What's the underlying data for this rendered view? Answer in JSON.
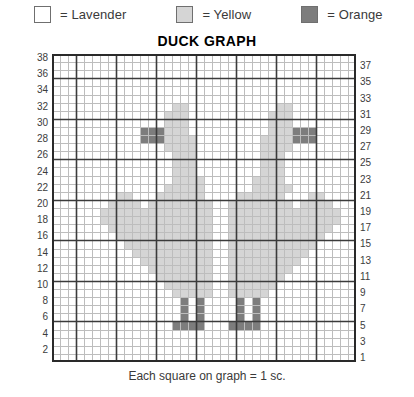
{
  "title": "DUCK GRAPH",
  "caption": "Each square on graph = 1 sc.",
  "legend": {
    "items": [
      {
        "label": "= Lavender",
        "color": "#ffffff",
        "key": "L"
      },
      {
        "label": "= Yellow",
        "color": "#d5d5d5",
        "key": "Y"
      },
      {
        "label": "= Orange",
        "color": "#7d7d7d",
        "key": "O"
      }
    ]
  },
  "axes": {
    "left_label": "row-numbers-even",
    "right_label": "row-numbers-odd",
    "left_ticks": [
      38,
      36,
      34,
      32,
      30,
      28,
      26,
      24,
      22,
      20,
      18,
      16,
      14,
      12,
      10,
      8,
      6,
      4,
      2
    ],
    "right_ticks": [
      37,
      35,
      33,
      31,
      29,
      27,
      25,
      23,
      21,
      19,
      17,
      15,
      13,
      11,
      9,
      7,
      5,
      3,
      1
    ]
  },
  "chart_data": {
    "type": "heatmap",
    "title": "DUCK GRAPH",
    "xlabel": "",
    "ylabel": "",
    "rows": 38,
    "cols": 38,
    "grid_on": true,
    "bold_every": 5,
    "legend_position": "top",
    "palette": {
      "L": "#ffffff",
      "Y": "#d5d5d5",
      "O": "#7d7d7d"
    },
    "colors_note": "L=Lavender(white), Y=Yellow(light gray), O=Orange(dark gray)",
    "row_order": "top row is 38, bottom row is 1",
    "cells": [
      "LLLLLLLLLLLLLLLLLLLLLLLLLLLLLLLLLLLLLL",
      "LLLLLLLLLLLLLLLLLLLLLLLLLLLLLLLLLLLLLL",
      "LLLLLLLLLLLLLLLLLLLLLLLLLLLLLLLLLLLLLL",
      "LLLLLLLLLLLLLLLLLLLLLLLLLLLLLLLLLLLLLL",
      "LLLLLLLLLLLLLLLLLLLLLLLLLLLLLLLLLLLLLL",
      "LLLLLLLLLLLLLLLLLLLLLLLLLLLLLLLLLLLLLL",
      "LLLLLLLLLLLLLLLYYLLLLLLLLLLLYYLLLLLLLL",
      "LLLLLLLLLLLLLLYYYLLLLLLLLLLYYYLLLLLLLL",
      "LLLLLLLLLLLLLLYYYLLLLLLLLLLYYYLLLLLLLL",
      "LLLLLLLLLLLOOOYYYLLLLLLLLLLYYYOOOLLLLL",
      "LLLLLLLLLLLOOOYYYYLLLLLLLLYYYYOOOLLLLL",
      "LLLLLLLLLLLLLLYYYYLLLLLLLLYYYYLLLLLLLL",
      "LLLLLLLLLLLLLLLYYYLLLLLLLLYYYLLLLLLLLL",
      "LLLLLLLLLLLLLLLYYYLLLLLLLLYYYLLLLLLLLL",
      "LLLLLLLLLLLLLLLYYYLLLLLLLLYYYLLLLLLLLL",
      "LLLLLLLLLLLLLLLYYYYLLLLLLYYYYLLLLLLLLL",
      "LLLLLLLLLLLLLLYYYYYLLLLLLYYYYYLLLLLLLL",
      "LLLLLLLLYYLLLYYYYYYLLLLYYYYYYLLLYYLLLL",
      "LLLLLLLYYYYLYYYYYYYYLLYYYYYYYYLYYYYLLL",
      "LLLLLLYYYYYYYYYYYYYYLLYYYYYYYYYYYYYYLL",
      "LLLLLLYYYYYYYYYYYYYYLLYYYYYYYYYYYYYYLL",
      "LLLLLLLYYYYYYYYYYYYYLLYYYYYYYYYYYYYLLL",
      "LLLLLLLLYYYYYYYYYYYYLLYYYYYYYYYYYYLLLL",
      "LLLLLLLLLYYYYYYYYYYYLLYYYYYYYYYYYLLLLL",
      "LLLLLLLLLLYYYYYYYYYYLLYYYYYYYYYYLLLLLL",
      "LLLLLLLLLLLYYYYYYYYYLLYYYYYYYYYLLLLLLL",
      "LLLLLLLLLLLLYYYYYYYYLLYYYYYYYYLLLLLLLL",
      "LLLLLLLLLLLLLYYYYYYYLLYYYYYYYLLLLLLLLL",
      "LLLLLLLLLLLLLLYYYYYYLLYYYYYYLLLLLLLLLL",
      "LLLLLLLLLLLLLLLYYYYYLLYYYYYLLLLLLLLLLL",
      "LLLLLLLLLLLLLLLLOLOLLLLOLOLLLLLLLLLLLL",
      "LLLLLLLLLLLLLLLLOLOLLLLOLOLLLLLLLLLLLL",
      "LLLLLLLLLLLLLLLLOLOLLLLOLOLLLLLLLLLLLL",
      "LLLLLLLLLLLLLLLOOOOLLLOOOOLLLLLLLLLLLL",
      "LLLLLLLLLLLLLLLLLLLLLLLLLLLLLLLLLLLLLL",
      "LLLLLLLLLLLLLLLLLLLLLLLLLLLLLLLLLLLLLL",
      "LLLLLLLLLLLLLLLLLLLLLLLLLLLLLLLLLLLLLL",
      "LLLLLLLLLLLLLLLLLLLLLLLLLLLLLLLLLLLLLL"
    ]
  }
}
